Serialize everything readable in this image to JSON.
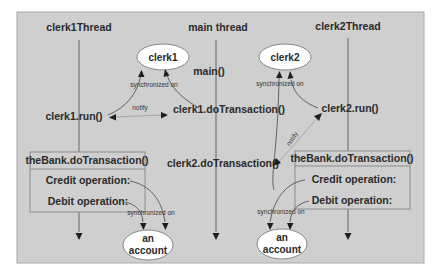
{
  "diagram": {
    "threads": [
      {
        "label": "clerk1Thread"
      },
      {
        "label": "main thread"
      },
      {
        "label": "clerk2Thread"
      }
    ],
    "objects": {
      "clerk1": "clerk1",
      "clerk2": "clerk2",
      "account1": {
        "line1": "an",
        "line2": "account"
      },
      "account2": {
        "line1": "an",
        "line2": "account"
      }
    },
    "calls": {
      "main": "main()",
      "clerk1_run": "clerk1.run()",
      "clerk1_do": "clerk1.doTransaction()",
      "clerk2_run": "clerk2.run()",
      "clerk2_do": "clerk2.doTransaction()"
    },
    "annotations": {
      "sync_clerk1": "synchronized on",
      "sync_clerk2": "synchronized on",
      "sync_account1": "synchronized on",
      "sync_account2": "synchronized on",
      "notify1": "notify",
      "notify2": "notify"
    },
    "bank_boxes": [
      {
        "title": "theBank.doTransaction()",
        "credit": "Credit operation:",
        "debit": "Debit operation:"
      },
      {
        "title": "theBank.doTransaction()",
        "credit": "Credit operation:",
        "debit": "Debit operation:"
      }
    ],
    "colors": {
      "panel": "#cfcfcf",
      "ellipse_fill": "#ffffff",
      "text": "#2a2a2a",
      "arrowhead": "#1e1e1e"
    }
  }
}
